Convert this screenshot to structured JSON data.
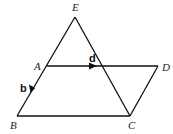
{
  "diagram": {
    "type": "geometry",
    "stroke_color": "#111111",
    "background": "#ffffff",
    "points": {
      "E": {
        "label": "E",
        "x": 75,
        "y": 17
      },
      "A": {
        "label": "A",
        "x": 47,
        "y": 66
      },
      "D": {
        "label": "D",
        "x": 158,
        "y": 66
      },
      "B": {
        "label": "B",
        "x": 17,
        "y": 116
      },
      "C": {
        "label": "C",
        "x": 130,
        "y": 116
      }
    },
    "segments": [
      {
        "from": "E",
        "to": "B"
      },
      {
        "from": "E",
        "to": "C"
      },
      {
        "from": "A",
        "to": "D"
      },
      {
        "from": "B",
        "to": "C"
      },
      {
        "from": "C",
        "to": "D"
      }
    ],
    "vectors": [
      {
        "label": "d",
        "on_segment": "A-D",
        "direction": "A to D"
      },
      {
        "label": "b",
        "on_segment": "A-B",
        "direction": "A to B"
      }
    ]
  }
}
